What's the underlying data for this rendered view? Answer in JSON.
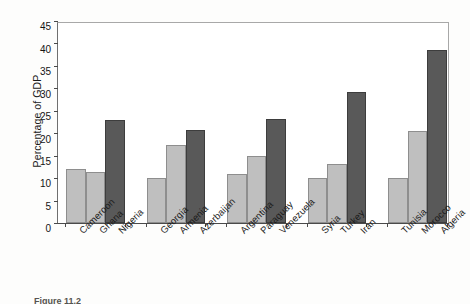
{
  "figure": {
    "caption": "Figure 11.2"
  },
  "chart_data": {
    "type": "bar",
    "title": "",
    "subtitle": "",
    "xlabel": "",
    "ylabel": "Percentage of GDP",
    "ylim": [
      0,
      45
    ],
    "ytick_values": [
      0,
      5,
      10,
      15,
      20,
      25,
      30,
      35,
      40,
      45
    ],
    "ytick_labels": [
      "0",
      "5",
      "10",
      "15",
      "20",
      "25",
      "30",
      "35",
      "40",
      "45"
    ],
    "grid": false,
    "legend": false,
    "legend_position": "none",
    "orientation": "vertical",
    "categories": [
      "Cameroon",
      "Ghana",
      "Nigeria",
      "Georgia",
      "Armenia",
      "Azerbaijan",
      "Argentina",
      "Paraguay",
      "Venezuela",
      "Syria",
      "Turkey",
      "Iran",
      "Tunisia",
      "Morocco",
      "Algeria"
    ],
    "values": [
      12.0,
      11.4,
      23.0,
      10.0,
      17.4,
      20.8,
      10.9,
      15.0,
      23.1,
      10.0,
      13.2,
      29.2,
      10.0,
      20.4,
      38.6
    ],
    "bar_styles": [
      "light",
      "light",
      "dark",
      "light",
      "light",
      "dark",
      "light",
      "light",
      "dark",
      "light",
      "light",
      "dark",
      "light",
      "light",
      "dark"
    ],
    "groups": [
      {
        "name": "Sub-Saharan Africa",
        "bars": [
          {
            "label": "Cameroon",
            "value": 12.0,
            "style": "light"
          },
          {
            "label": "Ghana",
            "value": 11.4,
            "style": "light"
          },
          {
            "label": "Nigeria",
            "value": 23.0,
            "style": "dark"
          }
        ]
      },
      {
        "name": "Caucasus",
        "bars": [
          {
            "label": "Georgia",
            "value": 10.0,
            "style": "light"
          },
          {
            "label": "Armenia",
            "value": 17.4,
            "style": "light"
          },
          {
            "label": "Azerbaijan",
            "value": 20.8,
            "style": "dark"
          }
        ]
      },
      {
        "name": "South America",
        "bars": [
          {
            "label": "Argentina",
            "value": 10.9,
            "style": "light"
          },
          {
            "label": "Paraguay",
            "value": 15.0,
            "style": "light"
          },
          {
            "label": "Venezuela",
            "value": 23.1,
            "style": "dark"
          }
        ]
      },
      {
        "name": "Middle East",
        "bars": [
          {
            "label": "Syria",
            "value": 10.0,
            "style": "light"
          },
          {
            "label": "Turkey",
            "value": 13.2,
            "style": "light"
          },
          {
            "label": "Iran",
            "value": 29.2,
            "style": "dark"
          }
        ]
      },
      {
        "name": "North Africa",
        "bars": [
          {
            "label": "Tunisia",
            "value": 10.0,
            "style": "light"
          },
          {
            "label": "Morocco",
            "value": 20.4,
            "style": "light"
          },
          {
            "label": "Algeria",
            "value": 38.6,
            "style": "dark"
          }
        ]
      }
    ],
    "colors": {
      "light_bar": "#bfbfbf",
      "light_bar_edge": "#8e8e8e",
      "dark_bar": "#595959",
      "dark_bar_edge": "#3d3d3d",
      "axis": "#4a4a4a",
      "text": "#1b1b1b",
      "background": "#ffffff"
    }
  }
}
